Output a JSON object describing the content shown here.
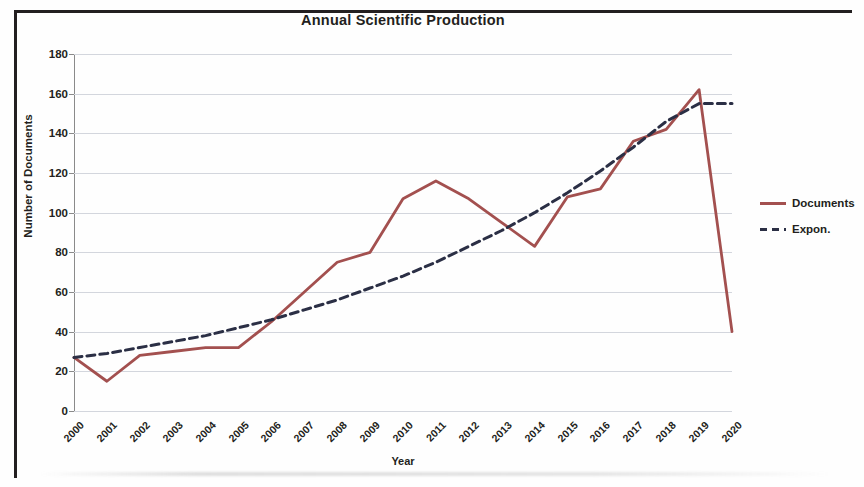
{
  "chart_data": {
    "type": "line",
    "title": "Annual Scientific Production",
    "xlabel": "Year",
    "ylabel": "Number of Documents",
    "categories": [
      "2000",
      "2001",
      "2002",
      "2003",
      "2004",
      "2005",
      "2006",
      "2007",
      "2008",
      "2009",
      "2010",
      "2011",
      "2012",
      "2013",
      "2014",
      "2015",
      "2016",
      "2017",
      "2018",
      "2019",
      "2020"
    ],
    "series": [
      {
        "name": "Documents",
        "style": "solid",
        "color": "#a3504f",
        "values": [
          27,
          15,
          28,
          30,
          32,
          32,
          45,
          60,
          75,
          80,
          107,
          116,
          107,
          95,
          83,
          108,
          112,
          136,
          142,
          162,
          40
        ]
      },
      {
        "name": "Expon.",
        "style": "dashed",
        "color": "#2b2f45",
        "values": [
          27,
          29,
          32,
          35,
          38,
          42,
          46,
          51,
          56,
          62,
          68,
          75,
          83,
          91,
          100,
          110,
          121,
          133,
          146,
          160,
          176
        ],
        "clip_max": 155
      }
    ],
    "ylim": [
      0,
      180
    ],
    "ytick_step": 20,
    "yticks": [
      0,
      20,
      40,
      60,
      80,
      100,
      120,
      140,
      160,
      180
    ],
    "grid": true,
    "legend_position": "right"
  },
  "legend": {
    "entries": [
      {
        "label": "Documents",
        "style": "solid"
      },
      {
        "label": "Expon.",
        "style": "dashed"
      }
    ]
  }
}
